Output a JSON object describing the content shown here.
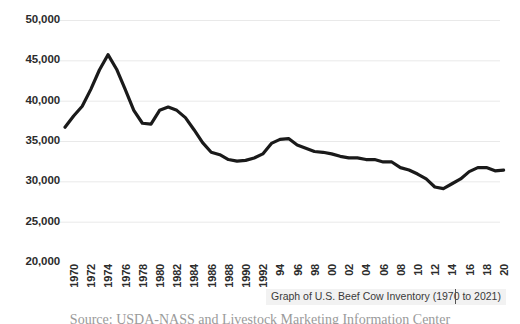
{
  "chart_data": {
    "type": "line",
    "title": "Graph of U.S. Beef Cow Inventory (1970 to 2021)",
    "xlabel": "",
    "ylabel": "",
    "ylim": [
      20000,
      50000
    ],
    "ytick_step": 5000,
    "yticks": [
      "20,000",
      "25,000",
      "30,000",
      "35,000",
      "40,000",
      "45,000",
      "50,000"
    ],
    "ytick_values": [
      20000,
      25000,
      30000,
      35000,
      40000,
      45000,
      50000
    ],
    "grid": true,
    "grid_axis": "y",
    "legend": false,
    "line_color": "#1a1a1a",
    "grid_color": "#e9e9e9",
    "xlim": [
      1970,
      2021
    ],
    "xtick_step": 2,
    "xtick_labels": [
      "1970",
      "1972",
      "1974",
      "1976",
      "1978",
      "1980",
      "1982",
      "1984",
      "1986",
      "1988",
      "1990",
      "1992",
      "94",
      "96",
      "98",
      "00",
      "02",
      "04",
      "06",
      "08",
      "10",
      "12",
      "14",
      "16",
      "18",
      "20"
    ],
    "xtick_values": [
      1970,
      1972,
      1974,
      1976,
      1978,
      1980,
      1982,
      1984,
      1986,
      1988,
      1990,
      1992,
      1994,
      1996,
      1998,
      2000,
      2002,
      2004,
      2006,
      2008,
      2010,
      2012,
      2014,
      2016,
      2018,
      2020
    ],
    "x": [
      1970,
      1971,
      1972,
      1973,
      1974,
      1975,
      1976,
      1977,
      1978,
      1979,
      1980,
      1981,
      1982,
      1983,
      1984,
      1985,
      1986,
      1987,
      1988,
      1989,
      1990,
      1991,
      1992,
      1993,
      1994,
      1995,
      1996,
      1997,
      1998,
      1999,
      2000,
      2001,
      2002,
      2003,
      2004,
      2005,
      2006,
      2007,
      2008,
      2009,
      2010,
      2011,
      2012,
      2013,
      2014,
      2015,
      2016,
      2017,
      2018,
      2019,
      2020,
      2021
    ],
    "values": [
      36700,
      38100,
      39300,
      41400,
      43800,
      45700,
      43900,
      41400,
      38800,
      37200,
      37100,
      38800,
      39200,
      38800,
      37900,
      36400,
      34800,
      33600,
      33300,
      32700,
      32500,
      32600,
      32900,
      33400,
      34700,
      35200,
      35300,
      34500,
      34100,
      33700,
      33600,
      33400,
      33100,
      32900,
      32900,
      32700,
      32700,
      32400,
      32400,
      31700,
      31400,
      30900,
      30300,
      29300,
      29100,
      29700,
      30300,
      31200,
      31700,
      31700,
      31300,
      31400
    ],
    "units": "thousand head"
  },
  "overlay": {
    "tooltip_text": "Graph of U.S. Beef Cow Inventory (1970 to 2021)",
    "caret": "|"
  },
  "footer": {
    "source_text": "Source: USDA-NASS and Livestock Marketing Information Center"
  }
}
